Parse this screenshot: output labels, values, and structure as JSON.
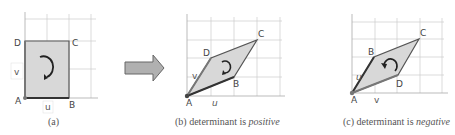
{
  "figure": {
    "panels": [
      {
        "id": "a",
        "caption": "(a)",
        "caption_emphasis": "",
        "shape": "square",
        "points": {
          "A": [
            25,
            98
          ],
          "B": [
            69,
            98
          ],
          "C": [
            69,
            41
          ],
          "D": [
            25,
            41
          ]
        },
        "labels": {
          "A": "A",
          "B": "B",
          "C": "C",
          "D": "D",
          "u": "u",
          "v": "v"
        },
        "rotation": "clockwise"
      },
      {
        "id": "b",
        "caption": "(b) determinant is ",
        "caption_emphasis": "positive",
        "shape": "parallelogram",
        "points": {
          "A": [
            187,
            96
          ],
          "B": [
            234,
            77
          ],
          "C": [
            257,
            40
          ],
          "D": [
            211,
            58
          ]
        },
        "labels": {
          "A": "A",
          "B": "B",
          "C": "C",
          "D": "D",
          "u": "u",
          "v": "v"
        },
        "rotation": "clockwise"
      },
      {
        "id": "c",
        "caption": "(c) determinant is ",
        "caption_emphasis": "negative",
        "shape": "parallelogram",
        "points": {
          "A": [
            352,
            93
          ],
          "B": [
            374,
            57
          ],
          "C": [
            419,
            39
          ],
          "D": [
            398,
            75
          ]
        },
        "labels": {
          "A": "A",
          "B": "B",
          "C": "C",
          "D": "D",
          "u": "u",
          "v": "v"
        },
        "rotation": "counterclockwise"
      }
    ],
    "transform_arrow": "right-arrow",
    "colors": {
      "fill": "#d8d8d8",
      "edge": "#555555",
      "grid": "#cccccc",
      "axis": "#aaaaaa",
      "arrow_fill": "#b0b0b0",
      "arrow_stroke": "#666666"
    }
  }
}
